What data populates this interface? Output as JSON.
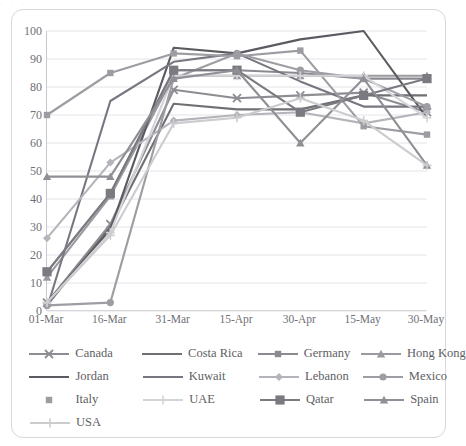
{
  "top_sliver_text": "· · ·",
  "chart_data": {
    "type": "line",
    "title": "",
    "xlabel": "",
    "ylabel": "",
    "ylim": [
      0,
      100
    ],
    "ytick_step": 10,
    "yticks": [
      100,
      90,
      80,
      70,
      60,
      50,
      40,
      30,
      20,
      10,
      0
    ],
    "grid": true,
    "legend_position": "bottom",
    "categories": [
      "01-Mar",
      "16-Mar",
      "31-Mar",
      "15-Apr",
      "30-Apr",
      "15-May",
      "30-May"
    ],
    "series": [
      {
        "name": "Canada",
        "color": "#8d8d92",
        "marker": "x",
        "values": [
          3,
          31,
          79,
          76,
          77,
          78,
          71
        ]
      },
      {
        "name": "Costa Rica",
        "color": "#6f6f74",
        "marker": "none",
        "values": [
          2,
          30,
          74,
          72,
          72,
          77,
          77
        ]
      },
      {
        "name": "Germany",
        "color": "#8a8a90",
        "marker": "smallsq",
        "values": [
          14,
          42,
          86,
          86,
          85,
          83,
          83
        ]
      },
      {
        "name": "Hong Kong",
        "color": "#9a9aa0",
        "marker": "triangle",
        "values": [
          12,
          41,
          84,
          84,
          84,
          84,
          84
        ]
      },
      {
        "name": "Jordan",
        "color": "#5a5a60",
        "marker": "none",
        "values": [
          3,
          29,
          94,
          92,
          97,
          100,
          69
        ]
      },
      {
        "name": "Kuwait",
        "color": "#777781",
        "marker": "none",
        "values": [
          1,
          75,
          89,
          92,
          82,
          73,
          73
        ]
      },
      {
        "name": "Lebanon",
        "color": "#b4b4ba",
        "marker": "diamond",
        "values": [
          26,
          53,
          68,
          70,
          71,
          67,
          71
        ]
      },
      {
        "name": "Mexico",
        "color": "#9d9da3",
        "marker": "circle",
        "values": [
          2,
          3,
          83,
          92,
          86,
          83,
          73
        ]
      },
      {
        "name": "Italy",
        "color": "#9c9ca2",
        "marker": "smallsq",
        "values": [
          70,
          85,
          92,
          91,
          93,
          66,
          63
        ]
      },
      {
        "name": "UAE",
        "color": "#d3d3d8",
        "marker": "plus",
        "values": [
          3,
          28,
          84,
          84,
          84,
          84,
          69
        ]
      },
      {
        "name": "Qatar",
        "color": "#7a7a80",
        "marker": "bigsq",
        "values": [
          14,
          42,
          86,
          86,
          71,
          77,
          83
        ]
      },
      {
        "name": "Spain",
        "color": "#8f8f95",
        "marker": "triangle",
        "values": [
          48,
          48,
          83,
          86,
          60,
          83,
          52
        ]
      },
      {
        "name": "USA",
        "color": "#cccccf",
        "marker": "plus",
        "values": [
          3,
          27,
          67,
          69,
          76,
          68,
          52
        ]
      }
    ]
  },
  "legend": {
    "rows": [
      [
        "Canada",
        "Costa Rica",
        "Germany",
        "Hong Kong"
      ],
      [
        "Jordan",
        "Kuwait",
        "Lebanon",
        "Mexico"
      ],
      [
        "Italy",
        "UAE",
        "Qatar",
        "Spain"
      ],
      [
        "USA"
      ]
    ]
  },
  "icons": {
    "x_marker": "x-marker-icon",
    "square_marker": "square-marker-icon",
    "triangle_marker": "triangle-marker-icon",
    "diamond_marker": "diamond-marker-icon",
    "circle_marker": "circle-marker-icon",
    "plus_marker": "plus-marker-icon"
  }
}
